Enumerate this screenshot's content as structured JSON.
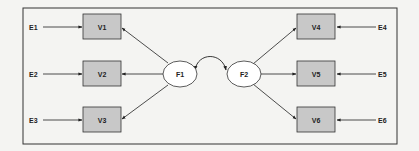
{
  "diagram": {
    "type": "structural-equation-model",
    "colors": {
      "background": "#f4f4f2",
      "frame": "#333333",
      "observed_fill": "#c8c8c8",
      "observed_stroke": "#333333",
      "latent_fill": "#ffffff",
      "line": "#222222"
    },
    "latent_factors": [
      {
        "id": "F1",
        "label": "F1"
      },
      {
        "id": "F2",
        "label": "F2"
      }
    ],
    "observed_variables": [
      {
        "id": "V1",
        "label": "V1",
        "factor": "F1"
      },
      {
        "id": "V2",
        "label": "V2",
        "factor": "F1"
      },
      {
        "id": "V3",
        "label": "V3",
        "factor": "F1"
      },
      {
        "id": "V4",
        "label": "V4",
        "factor": "F2"
      },
      {
        "id": "V5",
        "label": "V5",
        "factor": "F2"
      },
      {
        "id": "V6",
        "label": "V6",
        "factor": "F2"
      }
    ],
    "error_terms": [
      {
        "id": "E1",
        "label": "E1",
        "target": "V1"
      },
      {
        "id": "E2",
        "label": "E2",
        "target": "V2"
      },
      {
        "id": "E3",
        "label": "E3",
        "target": "V3"
      },
      {
        "id": "E4",
        "label": "E4",
        "target": "V4"
      },
      {
        "id": "E5",
        "label": "E5",
        "target": "V5"
      },
      {
        "id": "E6",
        "label": "E6",
        "target": "V6"
      }
    ],
    "covariances": [
      {
        "from": "F1",
        "to": "F2",
        "style": "curved-double-arrow"
      }
    ]
  }
}
